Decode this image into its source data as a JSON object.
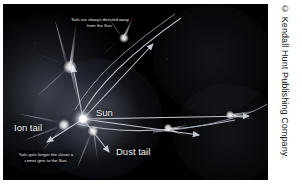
{
  "figure": {
    "kind": "comet-orbit-diagram",
    "background_color": "#000000",
    "plate_border_color": "#ffffff"
  },
  "annotations": {
    "note_top": "Tails are always directed away from the Sun.",
    "note_bottom": "Tails gets longer the closer a comet gets to the Sun."
  },
  "labels": {
    "sun": "Sun",
    "ion_tail": "Ion tail",
    "dust_tail": "Dust tail"
  },
  "credit": {
    "text": "© Kendall Hunt Publishing Company.",
    "color": "#1a1a1a"
  },
  "colors": {
    "comet_white": "#ffffff",
    "tail_glow": "#e8ecf5",
    "orbit_line": "#bfc4cf",
    "arrow": "#cfd3dc",
    "label_text": "#f2f2f0"
  }
}
